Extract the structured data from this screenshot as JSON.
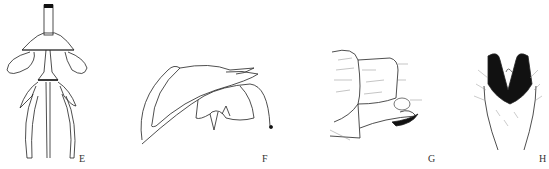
{
  "figure": {
    "panels": [
      {
        "id": "E",
        "label": "E",
        "description": "ventral view of genital structure with paired lateral lobes and elongate parameres"
      },
      {
        "id": "F",
        "label": "F",
        "description": "lateral view of curved genital capsule with hooked apex"
      },
      {
        "id": "G",
        "label": "G",
        "description": "lateral view of terminal segments with setae and dark sclerite"
      },
      {
        "id": "H",
        "label": "H",
        "description": "dorsal view of V-shaped dark sclerotized process with setae"
      }
    ],
    "colors": {
      "line": "#222222",
      "fill_dark": "#111111",
      "background": "#ffffff"
    }
  }
}
